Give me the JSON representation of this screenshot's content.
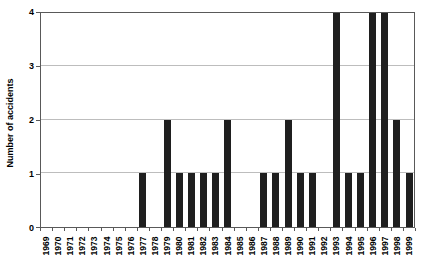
{
  "chart_data": {
    "type": "bar",
    "title": "",
    "xlabel": "",
    "ylabel": "Number of accidents",
    "categories": [
      "1969",
      "1970",
      "1971",
      "1972",
      "1973",
      "1974",
      "1975",
      "1976",
      "1977",
      "1978",
      "1979",
      "1980",
      "1981",
      "1982",
      "1983",
      "1984",
      "1985",
      "1986",
      "1987",
      "1988",
      "1989",
      "1990",
      "1991",
      "1992",
      "1993",
      "1994",
      "1995",
      "1996",
      "1997",
      "1998",
      "1999"
    ],
    "values": [
      0,
      0,
      0,
      0,
      0,
      0,
      0,
      0,
      1,
      0,
      2,
      1,
      1,
      1,
      1,
      2,
      0,
      0,
      1,
      1,
      2,
      1,
      1,
      0,
      4,
      1,
      1,
      4,
      4,
      2,
      1
    ],
    "ylim": [
      0,
      4
    ],
    "yticks": [
      0,
      1,
      2,
      3,
      4
    ],
    "grid": "horizontal",
    "legend_position": "none",
    "bar_color": "#1f1f1f",
    "gridline_color": "#bdbdbd",
    "axis_color": "#595959",
    "background_color": "#ffffff"
  }
}
